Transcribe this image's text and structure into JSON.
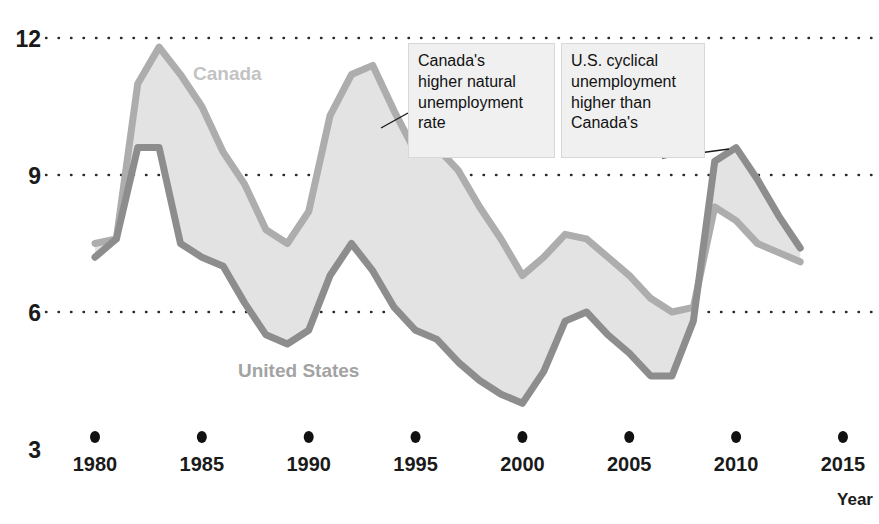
{
  "chart_data": {
    "type": "area",
    "title": "",
    "subtitle": "",
    "xlabel": "Year",
    "ylabel": "",
    "xlim": [
      1979.6,
      2014.2
    ],
    "ylim": [
      3,
      12
    ],
    "grid": "horizontal-dotted",
    "legend_position": "inline-labels",
    "x_tick_labels": [
      "1980",
      "1985",
      "1990",
      "1995",
      "2000",
      "2005",
      "2010",
      "2015"
    ],
    "x_ticks": [
      1980,
      1985,
      1990,
      1995,
      2000,
      2005,
      2010,
      2015
    ],
    "y_tick_labels": [
      "12",
      "9",
      "6",
      "3"
    ],
    "y_ticks": [
      12,
      9,
      6,
      3
    ],
    "x": [
      1980,
      1981,
      1982,
      1983,
      1984,
      1985,
      1986,
      1987,
      1988,
      1989,
      1990,
      1991,
      1992,
      1993,
      1994,
      1995,
      1996,
      1997,
      1998,
      1999,
      2000,
      2001,
      2002,
      2003,
      2004,
      2005,
      2006,
      2007,
      2008,
      2009,
      2010,
      2011,
      2012,
      2013
    ],
    "series": [
      {
        "name": "Canada",
        "color": "#adadad",
        "label_color": "#c3c3c3",
        "values": [
          7.5,
          7.6,
          11.0,
          11.8,
          11.2,
          10.5,
          9.5,
          8.8,
          7.8,
          7.5,
          8.2,
          10.3,
          11.2,
          11.4,
          10.4,
          9.5,
          9.6,
          9.1,
          8.3,
          7.6,
          6.8,
          7.2,
          7.7,
          7.6,
          7.2,
          6.8,
          6.3,
          6.0,
          6.1,
          8.3,
          8.0,
          7.5,
          7.3,
          7.1
        ]
      },
      {
        "name": "United States",
        "color": "#8d8d8d",
        "label_color": "#a3a3a3",
        "values": [
          7.2,
          7.6,
          9.6,
          9.6,
          7.5,
          7.2,
          7.0,
          6.2,
          5.5,
          5.3,
          5.6,
          6.8,
          7.5,
          6.9,
          6.1,
          5.6,
          5.4,
          4.9,
          4.5,
          4.2,
          4.0,
          4.7,
          5.8,
          6.0,
          5.5,
          5.1,
          4.6,
          4.6,
          5.8,
          9.3,
          9.6,
          8.9,
          8.1,
          7.4
        ]
      }
    ],
    "fill_color": "#e3e3e3",
    "annotations": [
      {
        "id": "canada-natural-rate",
        "text": "Canada's\nhigher natural\nunemployment\nrate",
        "x": 408,
        "y": 43,
        "width": 147,
        "height": 115,
        "leader_from_x": 408,
        "leader_from_y": 113,
        "leader_to_x": 381,
        "leader_to_y": 128
      },
      {
        "id": "us-cyclical",
        "text": "U.S. cyclical\nunemployment\nhigher than\nCanada's",
        "x": 561,
        "y": 43,
        "width": 144,
        "height": 115,
        "leader_from_x": 662,
        "leader_from_y": 158,
        "leader_to_x": 729,
        "leader_to_y": 149
      }
    ]
  }
}
